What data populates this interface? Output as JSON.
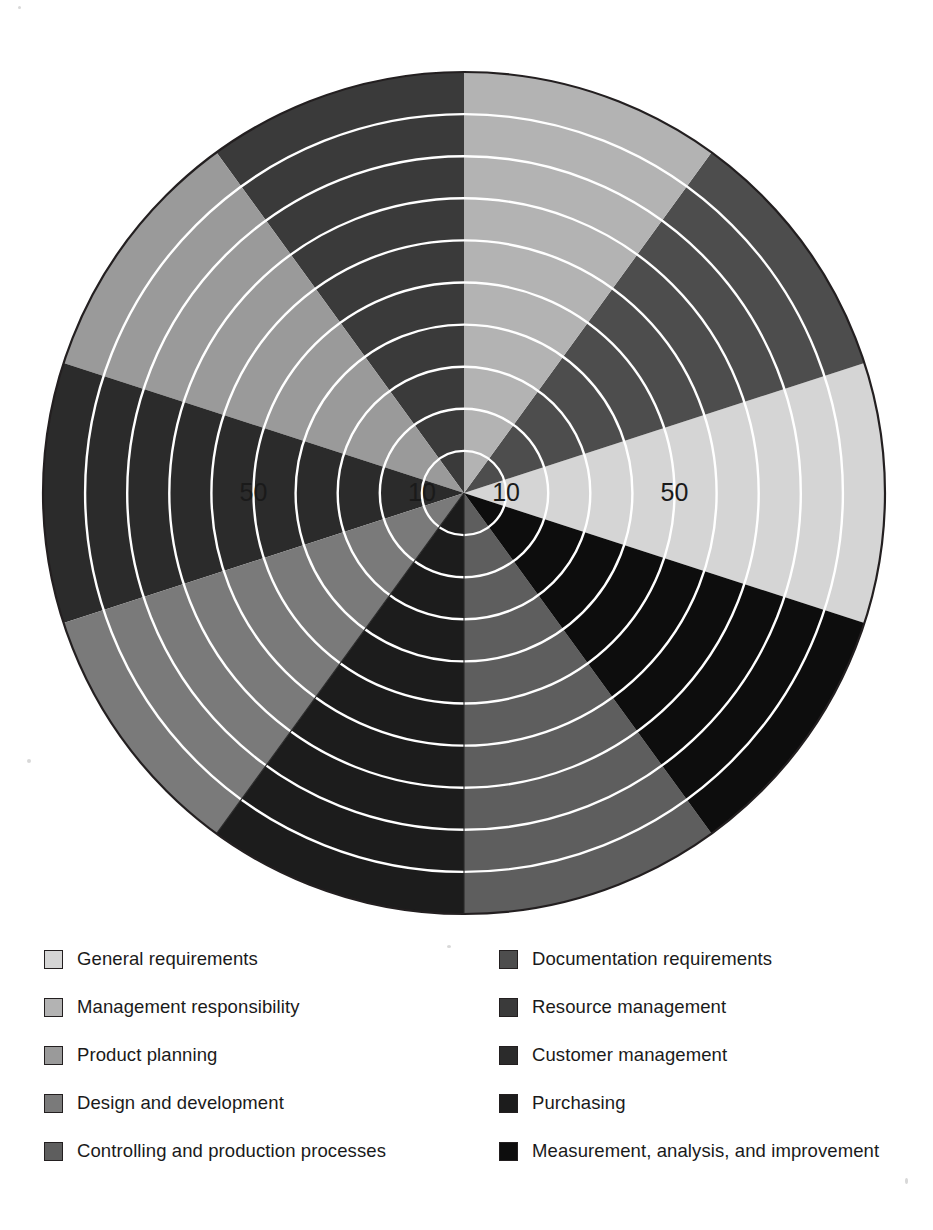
{
  "chart_data": {
    "type": "pie",
    "title": "",
    "subtitle": "",
    "xlabel": "",
    "ylabel": "",
    "legend_position": "bottom",
    "grid": true,
    "radial_axis": {
      "min": 0,
      "max": 100,
      "ring_step": 10,
      "ring_count": 10,
      "visible_tick_labels": [
        "10",
        "50"
      ],
      "tick_label_positions": [
        "left-10",
        "left-50",
        "right-10",
        "right-50"
      ],
      "tick_label_values": [
        10,
        50
      ]
    },
    "sector_count": 10,
    "sector_angle_deg": 36,
    "categories": [
      "General requirements",
      "Documentation requirements",
      "Management responsibility",
      "Resource management",
      "Product planning",
      "Customer management",
      "Design and development",
      "Purchasing",
      "Controlling and production processes",
      "Measurement, analysis, and improvement"
    ],
    "values": [
      100,
      100,
      100,
      100,
      100,
      100,
      100,
      100,
      100,
      100
    ],
    "colors": [
      "#d5d5d5",
      "#4d4d4d",
      "#b3b3b3",
      "#3a3a3a",
      "#9a9a9a",
      "#2b2b2b",
      "#7a7a7a",
      "#1c1c1c",
      "#5e5e5e",
      "#0d0d0d"
    ],
    "sectors": [
      {
        "index": 0,
        "label": "General requirements",
        "color": "#d5d5d5",
        "start_deg": -18,
        "end_deg": 18,
        "value": 100
      },
      {
        "index": 1,
        "label": "Documentation requirements",
        "color": "#4d4d4d",
        "start_deg": 18,
        "end_deg": 54,
        "value": 100
      },
      {
        "index": 2,
        "label": "Management responsibility",
        "color": "#b3b3b3",
        "start_deg": 54,
        "end_deg": 90,
        "value": 100
      },
      {
        "index": 3,
        "label": "Resource management",
        "color": "#3a3a3a",
        "start_deg": 90,
        "end_deg": 126,
        "value": 100
      },
      {
        "index": 4,
        "label": "Product planning",
        "color": "#9a9a9a",
        "start_deg": 126,
        "end_deg": 162,
        "value": 100
      },
      {
        "index": 5,
        "label": "Customer management",
        "color": "#2b2b2b",
        "start_deg": 162,
        "end_deg": 198,
        "value": 100
      },
      {
        "index": 6,
        "label": "Design and development",
        "color": "#7a7a7a",
        "start_deg": 198,
        "end_deg": 234,
        "value": 100
      },
      {
        "index": 7,
        "label": "Purchasing",
        "color": "#1c1c1c",
        "start_deg": 234,
        "end_deg": 270,
        "value": 100
      },
      {
        "index": 8,
        "label": "Controlling and production processes",
        "color": "#5e5e5e",
        "start_deg": 270,
        "end_deg": 306,
        "value": 100
      },
      {
        "index": 9,
        "label": "Measurement, analysis, and improvement",
        "color": "#0d0d0d",
        "start_deg": 306,
        "end_deg": 342,
        "value": 100
      }
    ],
    "gridline_color": "#ffffff",
    "outline_color": "#231f20",
    "background_color": "#ffffff"
  },
  "axis_labels": {
    "left_outer": "50",
    "left_inner": "10",
    "right_inner": "10",
    "right_outer": "50"
  },
  "legend": {
    "columns": [
      {
        "items": [
          {
            "label": "General requirements",
            "color": "#d5d5d5"
          },
          {
            "label": "Management responsibility",
            "color": "#b3b3b3"
          },
          {
            "label": "Product planning",
            "color": "#9a9a9a"
          },
          {
            "label": "Design and development",
            "color": "#7a7a7a"
          },
          {
            "label": "Controlling and production processes",
            "color": "#5e5e5e"
          }
        ]
      },
      {
        "items": [
          {
            "label": "Documentation requirements",
            "color": "#4d4d4d"
          },
          {
            "label": "Resource management",
            "color": "#3a3a3a"
          },
          {
            "label": "Customer management",
            "color": "#2b2b2b"
          },
          {
            "label": "Purchasing",
            "color": "#1c1c1c"
          },
          {
            "label": "Measurement, analysis, and improvement",
            "color": "#0d0d0d"
          }
        ]
      }
    ]
  },
  "geometry": {
    "center_x": 464,
    "center_y": 493,
    "radius": 421,
    "ring_spacing": 42.1
  }
}
